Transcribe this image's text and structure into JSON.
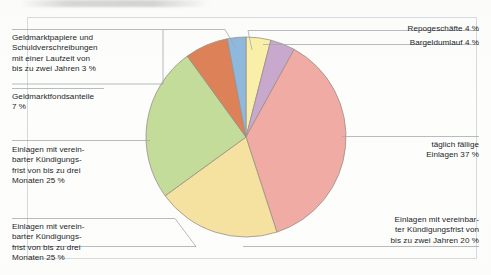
{
  "chart_data": {
    "type": "pie",
    "title": "",
    "legend_position": "callout-labels",
    "total_percent": 100,
    "unit": "%",
    "categories": [
      "Bargeldumlauf",
      "Repogeschäfte",
      "täglich fällige Einlagen",
      "Einlagen mit vereinbarter Kündigungsfrist von bis zu zwei Jahren",
      "Einlagen mit vereinbarter Kündigungsfrist von bis zu drei Monaten",
      "Einlagen mit vereinbarter Kündigungsfrist von bis zu drei Monaten",
      "Geldmarktfondsanteile",
      "Geldmarktpapiere und Schuldverschreibungen mit einer Laufzeit von bis zu zwei Jahren"
    ],
    "values": [
      4,
      4,
      37,
      20,
      25,
      25,
      7,
      3
    ],
    "slices": [
      {
        "name": "bargeldumlauf",
        "label": "Bargeldumlauf",
        "value": 4,
        "color": "#f9efa8"
      },
      {
        "name": "repogeschaefte",
        "label": "Repogeschäfte",
        "value": 4,
        "color": "#c9a8cd"
      },
      {
        "name": "taeglich-faellige",
        "label": "täglich fällige Einlagen",
        "value": 37,
        "color": "#f0aca4"
      },
      {
        "name": "zwei-jahren",
        "label": "Einlagen bis zwei Jahre",
        "value": 20,
        "color": "#f5e1a0"
      },
      {
        "name": "drei-monaten",
        "label": "Einlagen bis drei Monate",
        "value": 25,
        "color": "#c3dc9a"
      },
      {
        "name": "geldmarktfondsanteile",
        "label": "Geldmarktfondsanteile",
        "value": 7,
        "color": "#dd8258"
      },
      {
        "name": "geldmarktpapiere",
        "label": "Geldmarktpapiere",
        "value": 3,
        "color": "#8fb8dd"
      }
    ],
    "xlabel": "",
    "ylabel": ""
  },
  "labels": {
    "geldmarktpapiere": "Geldmarktpapiere und\nSchuldverschreibungen\nmit einer Laufzeit von\nbis zu zwei Jahren 3 %",
    "geldmarktfondsanteile": "Geldmarktfondsanteile\n7 %",
    "kuendigung_drei_monaten_oben": "Einlagen mit verein-\nbarter Kündigungs-\nfrist von bis zu drei\nMonaten 25 %",
    "kuendigung_drei_monaten_unten": "Einlagen mit verein-\nbarter Kündigungs-\nfrist von bis zu drei\nMonaten 25 %",
    "repogeschaefte": "Repogeschäfte 4 %",
    "bargeldumlauf": "Bargeldumlauf 4 %",
    "taeglich_faellige": "täglich fällige\nEinlagen 37 %",
    "kuendigung_zwei_jahren": "Einlagen mit vereinbar-\nter Kündigungsfrist von\nbis zu zwei Jahren 20 %"
  },
  "style": {
    "slice_stroke": "#9a8f86",
    "leader_line": "#9fa5ab",
    "frame": "#d6d9dd",
    "text": "#22262b",
    "background": "#fdfdfb"
  }
}
